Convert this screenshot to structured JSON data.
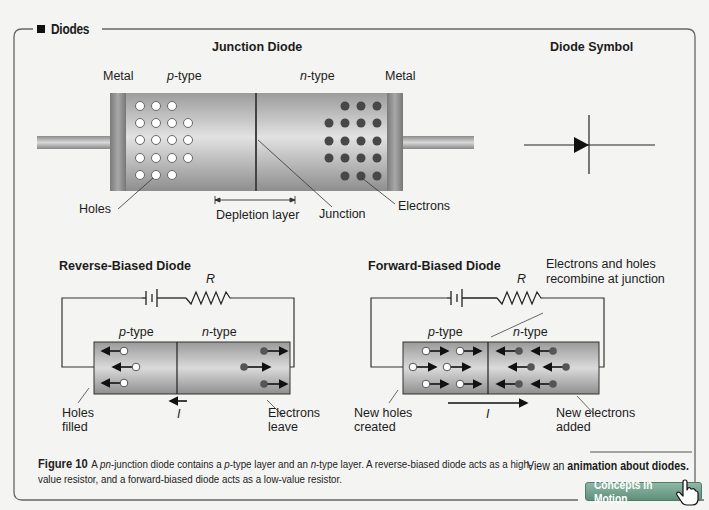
{
  "section": {
    "title": "Diodes"
  },
  "junction_diode": {
    "heading": "Junction Diode",
    "labels": {
      "metal_left": "Metal",
      "p_type_italic": "p",
      "p_type_suffix": "-type",
      "n_type_italic": "n",
      "n_type_suffix": "-type",
      "metal_right": "Metal",
      "holes": "Holes",
      "depletion_layer": "Depletion layer",
      "junction": "Junction",
      "electrons": "Electrons"
    },
    "holes_rows": [
      3,
      4,
      4,
      4,
      3
    ],
    "electron_rows": [
      3,
      4,
      4,
      4,
      3
    ]
  },
  "diode_symbol": {
    "heading": "Diode Symbol"
  },
  "reverse_biased": {
    "heading": "Reverse-Biased Diode",
    "resistor_label": "R",
    "p_type_italic": "p",
    "p_type_suffix": "-type",
    "n_type_italic": "n",
    "n_type_suffix": "-type",
    "current_label": "I",
    "left_note_line1": "Holes",
    "left_note_line2": "filled",
    "right_note_line1": "Electrons",
    "right_note_line2": "leave"
  },
  "forward_biased": {
    "heading": "Forward-Biased Diode",
    "resistor_label": "R",
    "p_type_italic": "p",
    "p_type_suffix": "-type",
    "n_type_italic": "n",
    "n_type_suffix": "-type",
    "current_label": "I",
    "top_note_line1": "Electrons and holes",
    "top_note_line2": "recombine at junction",
    "left_note_line1": "New holes",
    "left_note_line2": "created",
    "right_note_line1": "New electrons",
    "right_note_line2": "added"
  },
  "caption": {
    "figure_label": "Figure 10",
    "text_1": "A ",
    "pn_italic": "pn",
    "text_2": "-junction diode contains a ",
    "p_italic": "p",
    "text_3": "-type layer and an ",
    "n_italic": "n",
    "text_4": "-type layer. A reverse-biased diode acts as a high-value resistor, and a forward-biased diode acts as a low-value resistor."
  },
  "animation_link": {
    "prefix": "View an ",
    "link_text": "animation about diodes."
  },
  "concepts_button": {
    "label": "Concepts In Motion"
  },
  "colors": {
    "frame": "#6a6a6a",
    "body_gray": "#b9b9b9",
    "metal_dark": "#8a8a8a",
    "electron": "#444444",
    "hole_fill": "#ffffff",
    "button_green": "#6f9c89"
  }
}
